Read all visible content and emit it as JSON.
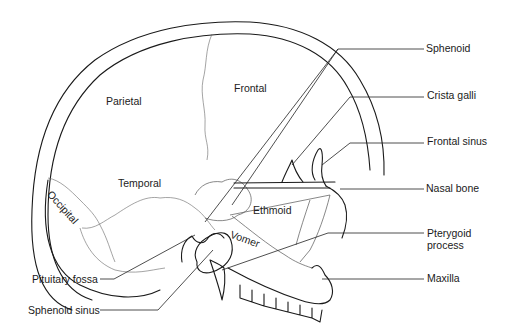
{
  "figure": {
    "bone_regions": [
      {
        "label": "Parietal"
      },
      {
        "label": "Frontal"
      },
      {
        "label": "Temporal"
      },
      {
        "label": "Occipital"
      },
      {
        "label": "Ethmoid"
      },
      {
        "label": "Vomer"
      }
    ],
    "right_callouts": [
      {
        "label": "Sphenoid"
      },
      {
        "label": "Crista galli"
      },
      {
        "label": "Frontal sinus"
      },
      {
        "label": "Nasal bone"
      },
      {
        "label": "Pterygoid process"
      },
      {
        "label": "Maxilla"
      }
    ],
    "left_callouts": [
      {
        "label": "Pituitary fossa"
      },
      {
        "label": "Sphenoid sinus"
      }
    ],
    "line_color": "#1a1a1a",
    "background": "#ffffff"
  }
}
